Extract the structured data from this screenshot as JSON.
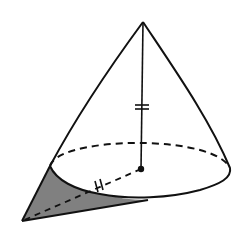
{
  "diagram": {
    "type": "geometry",
    "colors": {
      "stroke": "#111111",
      "shade": "#808080",
      "background": "#ffffff"
    },
    "elements": {
      "apex": {
        "x": 143,
        "y": 22
      },
      "base_center": {
        "x": 141,
        "y": 169
      },
      "base_ellipse": {
        "cx": 140,
        "cy": 168,
        "rx": 90,
        "ry": 27
      },
      "external_point": {
        "x": 22,
        "y": 221
      },
      "height_tick_marks": "=",
      "radius_tick_marks": "//"
    }
  }
}
